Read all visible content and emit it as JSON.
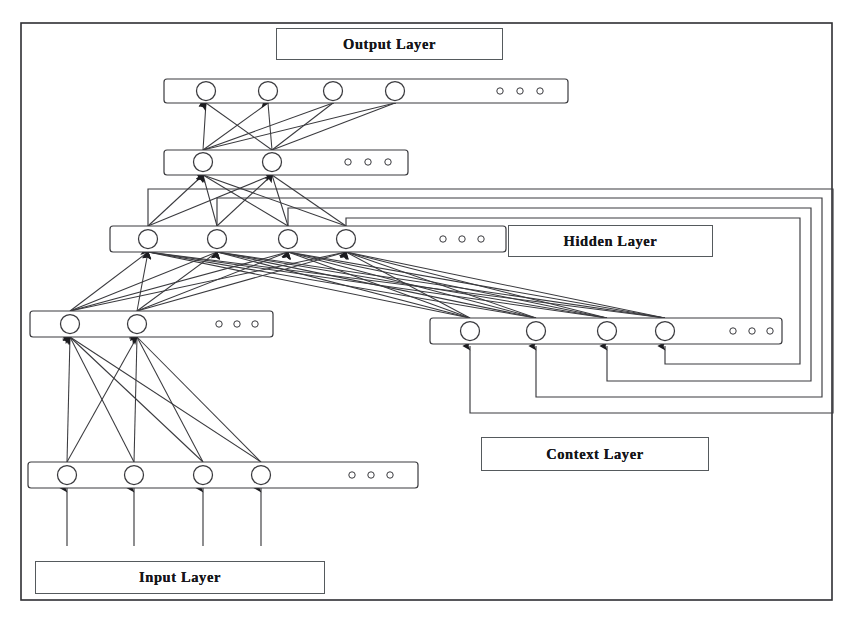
{
  "diagram": {
    "background_color": "#ffffff",
    "stroke_color": "#3a3a3e",
    "outer_frame": {
      "x": 21,
      "y": 23,
      "width": 811,
      "height": 577
    }
  },
  "labels": {
    "output": "Output Layer",
    "hidden": "Hidden Layer",
    "context": "Context Layer",
    "input": "Input Layer"
  },
  "layers": [
    {
      "id": "output-row-top",
      "name": "output-layer-top-row",
      "rect": {
        "x": 164,
        "y": 79,
        "width": 404,
        "height": 24
      },
      "nodes": [
        {
          "cx": 206,
          "cy": 91
        },
        {
          "cx": 268,
          "cy": 91
        },
        {
          "cx": 333,
          "cy": 91
        },
        {
          "cx": 395,
          "cy": 91
        }
      ],
      "ellipsis": [
        {
          "cx": 500,
          "cy": 91
        },
        {
          "cx": 520,
          "cy": 91
        },
        {
          "cx": 540,
          "cy": 91
        }
      ]
    },
    {
      "id": "output-row-lower",
      "name": "output-layer-lower-row",
      "rect": {
        "x": 164,
        "y": 150,
        "width": 244,
        "height": 25
      },
      "nodes": [
        {
          "cx": 203,
          "cy": 162
        },
        {
          "cx": 272,
          "cy": 162
        }
      ],
      "ellipsis": [
        {
          "cx": 348,
          "cy": 162
        },
        {
          "cx": 368,
          "cy": 162
        },
        {
          "cx": 388,
          "cy": 162
        }
      ]
    },
    {
      "id": "hidden-row",
      "name": "hidden-layer-row",
      "rect": {
        "x": 110,
        "y": 226,
        "width": 396,
        "height": 26
      },
      "nodes": [
        {
          "cx": 148,
          "cy": 239
        },
        {
          "cx": 217,
          "cy": 239
        },
        {
          "cx": 288,
          "cy": 239
        },
        {
          "cx": 346,
          "cy": 239
        }
      ],
      "ellipsis": [
        {
          "cx": 443,
          "cy": 239
        },
        {
          "cx": 462,
          "cy": 239
        },
        {
          "cx": 481,
          "cy": 239
        }
      ]
    },
    {
      "id": "hidden-row-left-lower",
      "name": "hidden-layer-left-lower-row",
      "rect": {
        "x": 30,
        "y": 311,
        "width": 243,
        "height": 26
      },
      "nodes": [
        {
          "cx": 70,
          "cy": 324
        },
        {
          "cx": 137,
          "cy": 324
        }
      ],
      "ellipsis": [
        {
          "cx": 219,
          "cy": 324
        },
        {
          "cx": 237,
          "cy": 324
        },
        {
          "cx": 255,
          "cy": 324
        }
      ]
    },
    {
      "id": "context-row",
      "name": "context-layer-row",
      "rect": {
        "x": 430,
        "y": 318,
        "width": 352,
        "height": 26
      },
      "nodes": [
        {
          "cx": 470,
          "cy": 331
        },
        {
          "cx": 536,
          "cy": 331
        },
        {
          "cx": 607,
          "cy": 331
        },
        {
          "cx": 665,
          "cy": 331
        }
      ],
      "ellipsis": [
        {
          "cx": 733,
          "cy": 331
        },
        {
          "cx": 752,
          "cy": 331
        },
        {
          "cx": 770,
          "cy": 331
        }
      ]
    },
    {
      "id": "input-row",
      "name": "input-layer-row",
      "rect": {
        "x": 28,
        "y": 462,
        "width": 390,
        "height": 26
      },
      "nodes": [
        {
          "cx": 67,
          "cy": 475
        },
        {
          "cx": 134,
          "cy": 475
        },
        {
          "cx": 203,
          "cy": 475
        },
        {
          "cx": 261,
          "cy": 475
        }
      ],
      "ellipsis": [
        {
          "cx": 352,
          "cy": 475
        },
        {
          "cx": 371,
          "cy": 475
        },
        {
          "cx": 390,
          "cy": 475
        }
      ]
    }
  ],
  "connections": {
    "external_inputs": {
      "name": "external-input-arrows",
      "from_y": 546,
      "to_y": 488,
      "x_positions": [
        67,
        134,
        203,
        261
      ]
    },
    "input_to_hiddenlower": {
      "name": "input-to-hidden-lower-connections",
      "from": [
        67,
        134,
        203,
        261
      ],
      "from_y": 462,
      "to": [
        70,
        137
      ],
      "to_y": 337
    },
    "hiddenlower_to_hidden": {
      "name": "hidden-lower-to-hidden-connections",
      "from": [
        70,
        137
      ],
      "from_y": 311,
      "to": [
        148,
        217,
        288,
        346
      ],
      "to_y": 252
    },
    "context_to_hidden": {
      "name": "context-to-hidden-connections",
      "from": [
        470,
        536,
        607,
        665
      ],
      "from_y": 318,
      "to": [
        148,
        217,
        288,
        346
      ],
      "to_y": 252
    },
    "hidden_to_outputlower": {
      "name": "hidden-to-output-lower-connections",
      "from": [
        148,
        217,
        288,
        346
      ],
      "from_y": 226,
      "to": [
        203,
        272
      ],
      "to_y": 175
    },
    "outputlower_to_outputtop": {
      "name": "output-lower-to-output-top-connections",
      "from": [
        203,
        272
      ],
      "from_y": 150,
      "to": [
        206,
        268,
        333,
        395
      ],
      "to_y": 103
    },
    "recurrent_loops": {
      "name": "recurrent-feedback-loops",
      "count": 4,
      "from_hidden_x": [
        148,
        217,
        288,
        346
      ],
      "top_y": [
        218,
        208,
        198,
        189
      ],
      "right_x": [
        800,
        811,
        822,
        833
      ],
      "bottom_y": [
        364,
        381,
        397,
        413
      ],
      "to_context_x": [
        665,
        607,
        536,
        470
      ],
      "to_context_y": 344
    }
  },
  "node_style": {
    "radius": 9.5,
    "fill": "#ffffff",
    "stroke": "#3a3a3e",
    "ellipsis_radius": 3.2
  }
}
